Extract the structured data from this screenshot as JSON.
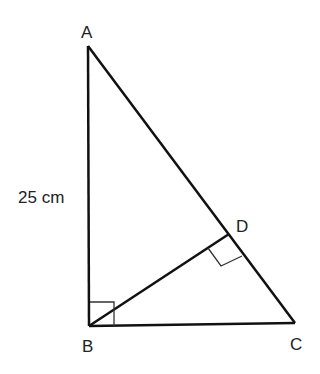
{
  "diagram": {
    "points": {
      "A": {
        "label": "A",
        "x": 88,
        "y": 46
      },
      "B": {
        "label": "B",
        "x": 89,
        "y": 326
      },
      "C": {
        "label": "C",
        "x": 295,
        "y": 323
      },
      "D": {
        "label": "D",
        "x": 229,
        "y": 234
      }
    },
    "segments": [
      {
        "from": "A",
        "to": "B"
      },
      {
        "from": "B",
        "to": "C"
      },
      {
        "from": "A",
        "to": "C"
      },
      {
        "from": "B",
        "to": "D"
      }
    ],
    "right_angles": [
      "B",
      "D"
    ],
    "measurement": {
      "side": "AB",
      "label": "25 cm"
    },
    "stroke_color": "#111111"
  }
}
